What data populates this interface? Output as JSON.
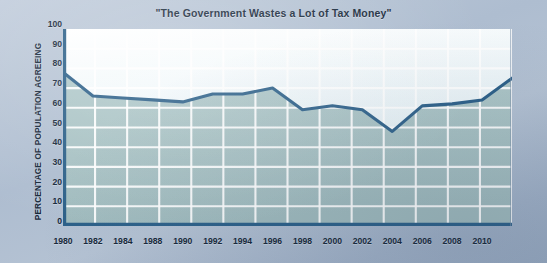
{
  "chart_data": {
    "type": "area",
    "title": "\"The Government Wastes a Lot of Tax Money\"",
    "xlabel": "",
    "ylabel": "PERCENTAGE OF POPULATION AGREEING",
    "ylim": [
      0,
      100
    ],
    "ytick_labels": [
      "100",
      "90",
      "80",
      "70",
      "60",
      "50",
      "40",
      "30",
      "20",
      "10",
      "0"
    ],
    "yticks": [
      100,
      90,
      80,
      70,
      60,
      50,
      40,
      30,
      20,
      10,
      0
    ],
    "xtick_labels": [
      "1980",
      "1982",
      "1984",
      "1988",
      "1990",
      "1992",
      "1994",
      "1996",
      "1998",
      "2000",
      "2002",
      "2004",
      "2006",
      "2008",
      "2010"
    ],
    "categories": [
      1980,
      1982,
      1984,
      1986,
      1988,
      1990,
      1992,
      1994,
      1996,
      1998,
      2000,
      2002,
      2004,
      2006,
      2008,
      2010
    ],
    "values": [
      78,
      66,
      65,
      64,
      63,
      67,
      67,
      70,
      59,
      61,
      59,
      48,
      61,
      62,
      64,
      75
    ],
    "grid": true,
    "grid_color": "#ffffff",
    "legend": "none",
    "series": [
      {
        "name": "Percentage of population agreeing",
        "values": [
          78,
          66,
          65,
          64,
          63,
          67,
          67,
          70,
          59,
          61,
          59,
          48,
          61,
          62,
          64,
          75
        ]
      }
    ],
    "colors": {
      "line": "#2e6189",
      "fill": "#a9c3c4",
      "plot_background": "#e8f2f6",
      "axis": "#2e6189",
      "page_background": "#b4c2d3",
      "text": "#16283a"
    }
  }
}
